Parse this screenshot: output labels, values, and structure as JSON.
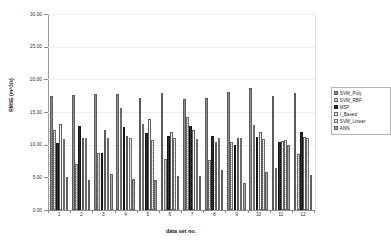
{
  "chart_data": {
    "type": "bar",
    "title": "",
    "xlabel": "data set no.",
    "ylabel": "RMSE (m^3/s)",
    "categories": [
      "1",
      "2",
      "3",
      "4",
      "5",
      "6",
      "7",
      "8",
      "9",
      "10",
      "11",
      "12"
    ],
    "ylim": [
      0,
      30
    ],
    "ytick_values": [
      0,
      5,
      10,
      15,
      20,
      25,
      30
    ],
    "ytick_labels": [
      "0.00",
      "5.00",
      "10.00",
      "15.00",
      "20.00",
      "25.00",
      "30.00"
    ],
    "grid": true,
    "legend_position": "right",
    "series": [
      {
        "name": "SVM_Poly",
        "swatch": "hatch-gray",
        "values": [
          17.4,
          17.6,
          17.8,
          17.8,
          17.2,
          17.9,
          17.0,
          17.2,
          18.0,
          18.6,
          17.4,
          17.9
        ]
      },
      {
        "name": "SVM_RBF",
        "swatch": "hatch-light",
        "values": [
          12.2,
          7.0,
          8.7,
          15.6,
          13.1,
          7.8,
          14.2,
          7.7,
          10.4,
          13.0,
          6.4,
          8.5
        ]
      },
      {
        "name": "M5P",
        "swatch": "solid-dark",
        "values": [
          10.3,
          12.9,
          8.8,
          12.7,
          11.8,
          11.3,
          12.8,
          11.4,
          9.9,
          11.2,
          10.4,
          12.0
        ]
      },
      {
        "name": "I_Based",
        "swatch": "solid-white",
        "values": [
          13.1,
          11.0,
          12.3,
          11.3,
          13.9,
          11.9,
          12.3,
          10.4,
          11.0,
          12.0,
          10.6,
          11.2
        ]
      },
      {
        "name": "SVM_Linear",
        "swatch": "hatch-white",
        "values": [
          10.8,
          11.0,
          11.0,
          11.0,
          10.7,
          11.0,
          10.8,
          11.0,
          11.0,
          10.9,
          10.7,
          11.0
        ]
      },
      {
        "name": "ANN",
        "swatch": "solid-gray",
        "values": [
          5.1,
          4.6,
          5.5,
          4.8,
          4.6,
          5.2,
          5.2,
          6.2,
          4.1,
          5.8,
          10.0,
          5.4
        ]
      }
    ]
  }
}
